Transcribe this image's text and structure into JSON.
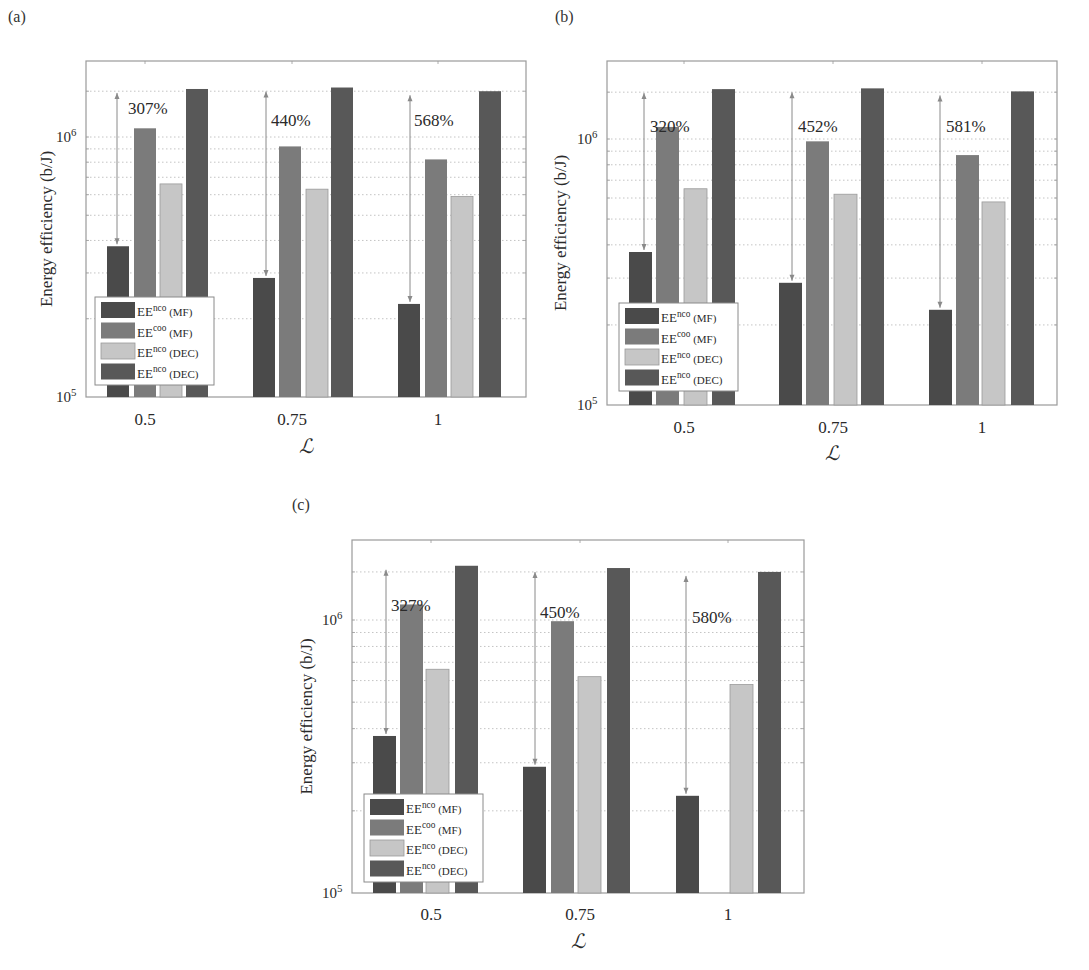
{
  "figure": {
    "panel_labels": [
      "(a)",
      "(b)",
      "(c)"
    ]
  },
  "chart_data": [
    {
      "type": "bar",
      "panel": "(a)",
      "title": "",
      "xlabel": "ℒ",
      "ylabel": "Energy efficiency (b/J)",
      "yscale": "log",
      "ylim": [
        100000,
        2000000
      ],
      "ytick_labels": [
        "10^5",
        "10^6"
      ],
      "grid": true,
      "legend_position": "lower left",
      "categories": [
        "0.5",
        "0.75",
        "1"
      ],
      "series": [
        {
          "name": "EE^nco (MF)",
          "values": [
            380000,
            287000,
            228000
          ]
        },
        {
          "name": "EE^coo (MF)",
          "values": [
            1080000,
            920000,
            820000
          ]
        },
        {
          "name": "EE^nco (DEC)",
          "values": [
            660000,
            630000,
            590000
          ]
        },
        {
          "name": "EE^nco (DEC)",
          "values": [
            1530000,
            1550000,
            1500000
          ]
        }
      ],
      "annotations": [
        "307%",
        "440%",
        "568%"
      ]
    },
    {
      "type": "bar",
      "panel": "(b)",
      "title": "",
      "xlabel": "ℒ",
      "ylabel": "Energy efficiency (b/J)",
      "yscale": "log",
      "ylim": [
        100000,
        2000000
      ],
      "ytick_labels": [
        "10^5",
        "10^6"
      ],
      "grid": true,
      "legend_position": "lower left",
      "categories": [
        "0.5",
        "0.75",
        "1"
      ],
      "series": [
        {
          "name": "EE^nco (MF)",
          "values": [
            376000,
            288000,
            228000
          ]
        },
        {
          "name": "EE^coo (MF)",
          "values": [
            1110000,
            980000,
            870000
          ]
        },
        {
          "name": "EE^nco (DEC)",
          "values": [
            650000,
            620000,
            580000
          ]
        },
        {
          "name": "EE^nco (DEC)",
          "values": [
            1540000,
            1550000,
            1510000
          ]
        }
      ],
      "annotations": [
        "320%",
        "452%",
        "581%"
      ]
    },
    {
      "type": "bar",
      "panel": "(c)",
      "title": "",
      "xlabel": "ℒ",
      "ylabel": "Energy efficiency (b/J)",
      "yscale": "log",
      "ylim": [
        100000,
        2000000
      ],
      "ytick_labels": [
        "10^5",
        "10^6"
      ],
      "grid": true,
      "legend_position": "lower left",
      "categories": [
        "0.5",
        "0.75",
        "1"
      ],
      "series": [
        {
          "name": "EE^nco (MF)",
          "values": [
            376000,
            290000,
            227000
          ]
        },
        {
          "name": "EE^coo (MF)",
          "values": [
            1140000,
            990000,
            null
          ]
        },
        {
          "name": "EE^nco (DEC)",
          "values": [
            660000,
            620000,
            580000
          ]
        },
        {
          "name": "EE^nco (DEC)",
          "values": [
            1580000,
            1550000,
            1500000
          ]
        }
      ],
      "annotations": [
        "327%",
        "450%",
        "580%"
      ]
    }
  ],
  "legend": [
    {
      "base": "EE",
      "sup": "nco",
      "suffix": "(MF)",
      "color": "#4a4a4a"
    },
    {
      "base": "EE",
      "sup": "coo",
      "suffix": "(MF)",
      "color": "#7b7b7b"
    },
    {
      "base": "EE",
      "sup": "nco",
      "suffix": "(DEC)",
      "color": "#c6c6c6"
    },
    {
      "base": "EE",
      "sup": "nco",
      "suffix": "(DEC)",
      "color": "#585858"
    }
  ],
  "colors": {
    "series": [
      "#4a4a4a",
      "#7b7b7b",
      "#c6c6c6",
      "#585858"
    ],
    "axis": "#9a9a9a",
    "grid": "#b5b5b5",
    "arrow": "#8a8a8a"
  }
}
